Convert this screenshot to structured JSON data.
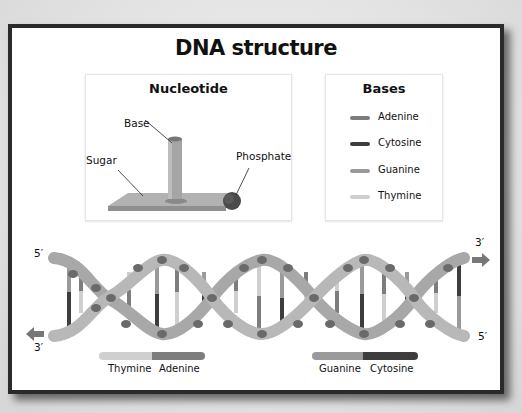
{
  "title": "DNA structure",
  "nucleotide": {
    "heading": "Nucleotide",
    "labels": {
      "base": "Base",
      "sugar": "Sugar",
      "phosphate": "Phosphate"
    }
  },
  "bases": {
    "heading": "Bases",
    "items": [
      {
        "name": "Adenine",
        "color": "#7d7d7d"
      },
      {
        "name": "Cytosine",
        "color": "#3d3d3d"
      },
      {
        "name": "Guanine",
        "color": "#9a9a9a"
      },
      {
        "name": "Thymine",
        "color": "#cfcfcf"
      }
    ]
  },
  "helix": {
    "left_top_end": "5′",
    "left_bottom_end": "3′",
    "right_top_end": "3′",
    "right_bottom_end": "5′",
    "strand_color": "#a8a8a8",
    "phosphate_color": "#6a6a6a"
  },
  "pairs": [
    {
      "left": "Thymine",
      "right": "Adenine",
      "left_color": "#cfcfcf",
      "right_color": "#7d7d7d"
    },
    {
      "left": "Guanine",
      "right": "Cytosine",
      "left_color": "#9a9a9a",
      "right_color": "#3d3d3d"
    }
  ]
}
